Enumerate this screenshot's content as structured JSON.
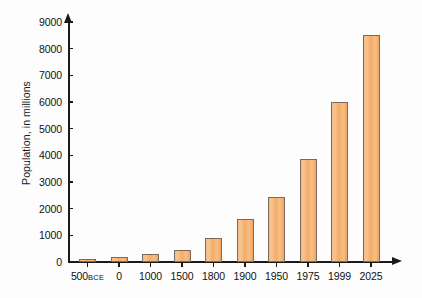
{
  "chart_data": {
    "type": "bar",
    "title": "",
    "subtitle": "",
    "xlabel": "",
    "ylabel": "Population, in millions",
    "categories": [
      "500BCE",
      "0",
      "1000",
      "1500",
      "1800",
      "1900",
      "1950",
      "1975",
      "1999",
      "2025"
    ],
    "category_parts": [
      {
        "main": "500",
        "era": "BCE"
      },
      {
        "main": "0",
        "era": ""
      },
      {
        "main": "1000",
        "era": ""
      },
      {
        "main": "1500",
        "era": ""
      },
      {
        "main": "1800",
        "era": ""
      },
      {
        "main": "1900",
        "era": ""
      },
      {
        "main": "1950",
        "era": ""
      },
      {
        "main": "1975",
        "era": ""
      },
      {
        "main": "1999",
        "era": ""
      },
      {
        "main": "2025",
        "era": ""
      }
    ],
    "values": [
      100,
      170,
      300,
      460,
      900,
      1600,
      2450,
      3850,
      6000,
      8500
    ],
    "ylim": [
      0,
      9000
    ],
    "ytick_values": [
      0,
      1000,
      2000,
      3000,
      4000,
      5000,
      6000,
      7000,
      8000,
      9000
    ],
    "ytick_labels": [
      "0",
      "1000",
      "2000",
      "3000",
      "4000",
      "5000",
      "6000",
      "7000",
      "8000",
      "9000"
    ],
    "grid": false,
    "legend": false,
    "legend_position": "none",
    "bar_fill_color": "#f4b077",
    "bar_border_color": "#7d6a5c",
    "axis_color": "#1a1a1a",
    "background_color": "#fdfdfd"
  }
}
